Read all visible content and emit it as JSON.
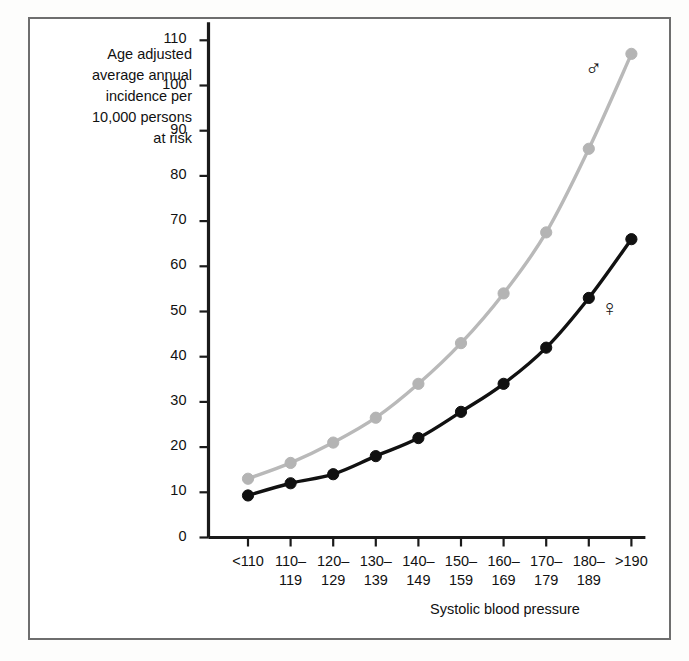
{
  "chart_data": {
    "type": "line",
    "title": "",
    "xlabel": "Systolic blood pressure",
    "ylabel": "Age adjusted\naverage annual\nincidence per\n10,000 persons\nat risk",
    "categories": [
      "<110",
      "110–\n119",
      "120–\n129",
      "130–\n139",
      "140–\n149",
      "150–\n159",
      "160–\n169",
      "170–\n179",
      "180–\n189",
      ">190"
    ],
    "category_values": [
      "<110",
      "110-119",
      "120-129",
      "130-139",
      "140-149",
      "150-159",
      "160-169",
      "170-179",
      "180-189",
      ">190"
    ],
    "yticks": [
      0,
      10,
      20,
      30,
      40,
      50,
      60,
      70,
      80,
      90,
      100,
      110
    ],
    "ylim": [
      0,
      114
    ],
    "grid": false,
    "legend_position": "inline-annotation",
    "series": [
      {
        "name": "Men",
        "symbol": "♂",
        "color": "#b9b9b9",
        "marker_color": "#b4b4b4",
        "values": [
          13,
          16.5,
          21,
          26.5,
          34,
          43,
          54,
          67.5,
          86,
          107
        ]
      },
      {
        "name": "Women",
        "symbol": "♀",
        "color": "#111111",
        "marker_color": "#111111",
        "values": [
          9.3,
          12,
          14,
          18,
          22,
          27.8,
          34,
          42,
          53,
          66
        ]
      }
    ],
    "annotations": [
      {
        "text": "♂",
        "series": "Men",
        "x_px": 585,
        "y_px": 60
      },
      {
        "text": "♀",
        "series": "Women",
        "x_px": 601,
        "y_px": 300
      }
    ]
  },
  "figure": {
    "frame_color": "#6e6e6e",
    "background": "#ffffff"
  }
}
